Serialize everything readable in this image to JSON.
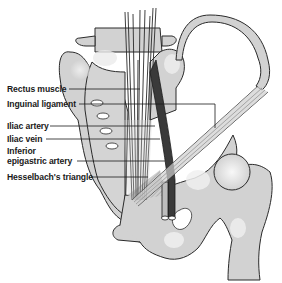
{
  "figure": {
    "colors": {
      "bone": "#d2d2d2",
      "bone_highlight": "#f4f4f4",
      "outline": "#2a2a2a",
      "vessel_dark": "#3a3a3a",
      "vessel_light": "#bdbdbd",
      "background": "#ffffff"
    },
    "labels": [
      {
        "id": "rectus-muscle",
        "text": "Rectus muscle"
      },
      {
        "id": "inguinal-ligament",
        "text": "Inguinal ligament"
      },
      {
        "id": "iliac-artery",
        "text": "Iliac artery"
      },
      {
        "id": "iliac-vein",
        "text": "Iliac vein"
      },
      {
        "id": "inferior",
        "text": "Inferior"
      },
      {
        "id": "epigastric-artery",
        "text": "epigastric artery"
      },
      {
        "id": "hesselbachs-triangle",
        "text": "Hesselbach's triangle"
      }
    ]
  }
}
